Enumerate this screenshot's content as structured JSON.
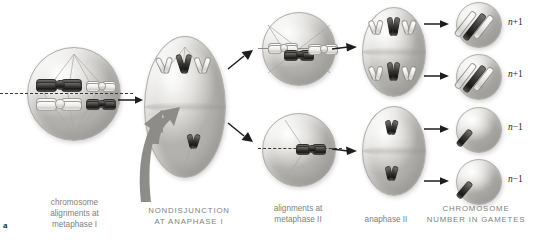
{
  "figure": {
    "panel_letter": "a",
    "title_implied": "Nondisjunction at anaphase I of meiosis"
  },
  "captions": [
    {
      "id": "metaphase-i",
      "text": "chromosome\nalignments at\nmetaphase I",
      "style": "lowercase"
    },
    {
      "id": "nondisjunction",
      "text": "NONDISJUNCTION\nAT ANAPHASE I",
      "style": "uppercase"
    },
    {
      "id": "metaphase-ii",
      "text": "alignments at\nmetaphase II",
      "style": "lowercase"
    },
    {
      "id": "anaphase-ii",
      "text": "anaphase II",
      "style": "lowercase"
    },
    {
      "id": "gametes",
      "text": "CHROMOSOME\nNUMBER IN GAMETES",
      "style": "uppercase"
    }
  ],
  "caption_lines": {
    "metaphase_i": [
      "chromosome",
      "alignments at",
      "metaphase I"
    ],
    "nondisjunction": [
      "NONDISJUNCTION",
      "AT ANAPHASE I"
    ],
    "metaphase_ii": [
      "alignments at",
      "metaphase II"
    ],
    "anaphase_ii": [
      "anaphase II"
    ],
    "gametes": [
      "CHROMOSOME",
      "NUMBER IN GAMETES"
    ]
  },
  "gamete_labels": [
    {
      "id": "gamete-1",
      "text": "n +1",
      "n": "n",
      "sign": "+1"
    },
    {
      "id": "gamete-2",
      "text": "n +1",
      "n": "n",
      "sign": "+1"
    },
    {
      "id": "gamete-3",
      "text": "n −1",
      "n": "n",
      "sign": "−1"
    },
    {
      "id": "gamete-4",
      "text": "n −1",
      "n": "n",
      "sign": "−1"
    }
  ],
  "stages": [
    {
      "id": "stage-metaphase-i",
      "shape": "sphere",
      "chromosome_count": 4,
      "description": "Two homologous pairs aligned on the metaphase plate; one large dark pair, one large light pair, one small light pair, one small dark pair."
    },
    {
      "id": "stage-anaphase-i-nondisjunction",
      "shape": "elongated-oval",
      "chromosome_groups": [
        {
          "pole": "top",
          "count": 3
        },
        {
          "pole": "bottom",
          "count": 1
        }
      ],
      "description": "Nondisjunction: homologues fail to separate, three chromosomes move to the top pole and one to the bottom pole."
    },
    {
      "id": "stage-metaphase-ii-top",
      "shape": "sphere",
      "chromosome_count": 3,
      "description": "Three chromosomes aligned on the metaphase II plate."
    },
    {
      "id": "stage-metaphase-ii-bottom",
      "shape": "sphere",
      "chromosome_count": 1,
      "description": "One chromosome aligned on the metaphase II plate."
    },
    {
      "id": "stage-anaphase-ii-top",
      "shape": "oval",
      "chromosome_groups": [
        {
          "pole": "top",
          "count": 3
        },
        {
          "pole": "bottom",
          "count": 3
        }
      ],
      "description": "Sister chromatids separate; three chromosomes to each pole."
    },
    {
      "id": "stage-anaphase-ii-bottom",
      "shape": "oval",
      "chromosome_groups": [
        {
          "pole": "top",
          "count": 1
        },
        {
          "pole": "bottom",
          "count": 1
        }
      ],
      "description": "Sister chromatids separate; one chromosome to each pole."
    }
  ],
  "gametes": [
    {
      "id": "gamete-cell-1",
      "chromosome_count": 3,
      "label": "n +1"
    },
    {
      "id": "gamete-cell-2",
      "chromosome_count": 3,
      "label": "n +1"
    },
    {
      "id": "gamete-cell-3",
      "chromosome_count": 1,
      "label": "n −1"
    },
    {
      "id": "gamete-cell-4",
      "chromosome_count": 1,
      "label": "n −1"
    }
  ],
  "colors": {
    "background": "#ffffff",
    "caption_text": "#807f7d",
    "label_text": "#1f1f1f",
    "arrow": "#1d1d1d",
    "big_arrow": "#8d8c89",
    "cell_fill_light": "#f2f2f1",
    "cell_fill_shadow": "#b3b2af",
    "chromosome_dark": "#2a2a29",
    "chromosome_light": "#e6e5e3",
    "plate_line": "#3a3a3a"
  }
}
